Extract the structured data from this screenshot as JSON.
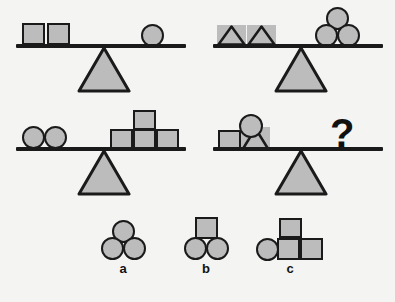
{
  "puzzle": {
    "type": "balance-scale-reasoning",
    "unknown_marker": "?",
    "colors": {
      "background": "#f4f4f2",
      "shape_fill": "#bcbcbc",
      "outline": "#1a1a1a",
      "text": "#111111"
    },
    "scales": [
      {
        "id": "scale-1",
        "state": "balanced",
        "left": {
          "shapes": [
            "square",
            "square"
          ],
          "counts": {
            "square": 2,
            "circle": 0,
            "triangle": 0
          }
        },
        "right": {
          "shapes": [
            "circle"
          ],
          "counts": {
            "square": 0,
            "circle": 1,
            "triangle": 0
          }
        },
        "equation": "2 squares = 1 circle"
      },
      {
        "id": "scale-2",
        "state": "balanced",
        "left": {
          "shapes": [
            "triangle",
            "triangle"
          ],
          "counts": {
            "square": 0,
            "circle": 0,
            "triangle": 2
          }
        },
        "right": {
          "shapes": [
            "circle",
            "circle",
            "circle"
          ],
          "counts": {
            "square": 0,
            "circle": 3,
            "triangle": 0
          }
        },
        "equation": "2 triangles = 3 circles"
      },
      {
        "id": "scale-3",
        "state": "balanced",
        "left": {
          "shapes": [
            "circle",
            "circle"
          ],
          "counts": {
            "square": 0,
            "circle": 2,
            "triangle": 0
          }
        },
        "right": {
          "shapes": [
            "square",
            "square",
            "square",
            "square"
          ],
          "counts": {
            "square": 4,
            "circle": 0,
            "triangle": 0
          }
        },
        "equation": "2 circles = 4 squares"
      },
      {
        "id": "scale-4",
        "state": "unknown",
        "left": {
          "shapes": [
            "square",
            "triangle",
            "circle"
          ],
          "counts": {
            "square": 1,
            "circle": 1,
            "triangle": 1
          }
        },
        "right": {
          "shapes": [
            "question-mark"
          ],
          "counts": {}
        },
        "equation": "1 square + 1 triangle + 1 circle = ?"
      }
    ],
    "options": [
      {
        "id": "option-a",
        "label": "a",
        "shapes": [
          "circle",
          "circle",
          "circle"
        ],
        "counts": {
          "square": 0,
          "circle": 3,
          "triangle": 0
        },
        "arrangement": "two circles bottom, one circle on top"
      },
      {
        "id": "option-b",
        "label": "b",
        "shapes": [
          "square",
          "circle",
          "circle"
        ],
        "counts": {
          "square": 1,
          "circle": 2,
          "triangle": 0
        },
        "arrangement": "two circles bottom, one square on top"
      },
      {
        "id": "option-c",
        "label": "c",
        "shapes": [
          "circle",
          "square",
          "square",
          "square"
        ],
        "counts": {
          "square": 3,
          "circle": 1,
          "triangle": 0
        },
        "arrangement": "circle and two squares bottom, one square on top"
      }
    ]
  }
}
